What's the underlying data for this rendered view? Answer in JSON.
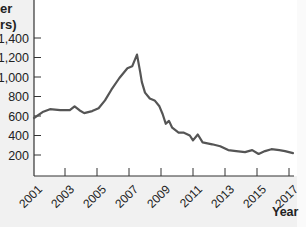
{
  "chart_data": {
    "type": "line",
    "title": "",
    "ylabel_visible_fragments": [
      "er",
      "rs)"
    ],
    "xlabel": "Year",
    "ylim": [
      100,
      1500
    ],
    "xlim": [
      2001,
      2017.3
    ],
    "y_ticks": [
      200,
      400,
      600,
      800,
      1000,
      1200,
      1400
    ],
    "y_tick_labels": [
      "200",
      "400",
      "600",
      "800",
      "1,000",
      "1,200",
      "$1,400"
    ],
    "x_ticks": [
      2001,
      2003,
      2005,
      2007,
      2009,
      2011,
      2013,
      2015,
      2017
    ],
    "x_tick_labels": [
      "2001",
      "2003",
      "2005",
      "2007",
      "2009",
      "2011",
      "2013",
      "2015",
      "2017"
    ],
    "grid": false,
    "legend": null,
    "series": [
      {
        "name": "value",
        "color": "#555555",
        "x": [
          2001.06,
          2001.6,
          2002.06,
          2002.7,
          2003.3,
          2003.6,
          2003.9,
          2004.2,
          2004.7,
          2005.1,
          2005.5,
          2005.9,
          2006.4,
          2006.9,
          2007.2,
          2007.3,
          2007.5,
          2007.7,
          2007.8,
          2008.0,
          2008.3,
          2008.6,
          2008.9,
          2009.1,
          2009.3,
          2009.5,
          2009.7,
          2010.1,
          2010.4,
          2010.8,
          2011.0,
          2011.3,
          2011.6,
          2012.2,
          2012.7,
          2013.2,
          2013.7,
          2014.25,
          2014.7,
          2015.1,
          2015.5,
          2015.9,
          2016.4,
          2016.75,
          2017.25
        ],
        "values": [
          580,
          640,
          670,
          660,
          660,
          700,
          660,
          630,
          650,
          680,
          760,
          870,
          990,
          1090,
          1110,
          1150,
          1230,
          1050,
          950,
          840,
          780,
          760,
          700,
          620,
          520,
          550,
          480,
          430,
          430,
          400,
          350,
          410,
          330,
          310,
          290,
          250,
          240,
          230,
          250,
          210,
          240,
          260,
          250,
          240,
          220
        ]
      }
    ]
  },
  "labels": {
    "ylabel_line1": "er",
    "ylabel_line2": "rs)",
    "xlabel": "Year",
    "y_ticks": [
      "$1,400",
      "1,200",
      "1,000",
      "800",
      "600",
      "400",
      "200"
    ],
    "x_ticks": [
      "2001",
      "2003",
      "2005",
      "2007",
      "2009",
      "2011",
      "2013",
      "2015",
      "2017"
    ]
  }
}
